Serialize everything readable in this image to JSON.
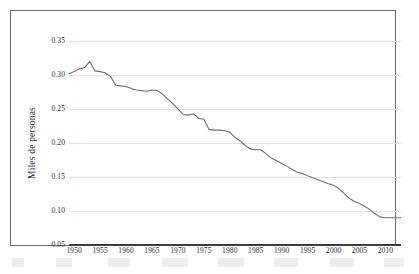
{
  "chart_data": {
    "type": "line",
    "title": "",
    "subtitle": "",
    "xlabel": "",
    "ylabel": "Miles de personas",
    "xlim": [
      1949,
      2013
    ],
    "ylim": [
      0.05,
      0.35
    ],
    "grid": true,
    "legend": false,
    "legend_position": "none",
    "line_color": "#6e6e6e",
    "gridline_color": "#e3e3e3",
    "axis_color": "#3d3d3d",
    "frame_color": "#6b6b6b",
    "ytick_labels": [
      "0.35",
      "0.30",
      "0.25",
      "0.20",
      "0.15",
      "0.10",
      "0.05"
    ],
    "ytick_values": [
      0.35,
      0.3,
      0.25,
      0.2,
      0.15,
      0.1,
      0.05
    ],
    "xtick_labels": [
      "1950",
      "1955",
      "1960",
      "1965",
      "1970",
      "1975",
      "1980",
      "1985",
      "1990",
      "1995",
      "2000",
      "2005",
      "2010"
    ],
    "xtick_values": [
      1950,
      1955,
      1960,
      1965,
      1970,
      1975,
      1980,
      1985,
      1990,
      1995,
      2000,
      2005,
      2010
    ],
    "series": [
      {
        "name": "Miles de personas",
        "x": [
          1949,
          1950,
          1951,
          1952,
          1953,
          1954,
          1955,
          1956,
          1957,
          1958,
          1959,
          1960,
          1961,
          1962,
          1963,
          1964,
          1965,
          1966,
          1967,
          1968,
          1969,
          1970,
          1971,
          1972,
          1973,
          1974,
          1975,
          1976,
          1977,
          1978,
          1979,
          1980,
          1981,
          1982,
          1983,
          1984,
          1985,
          1986,
          1987,
          1988,
          1989,
          1990,
          1991,
          1992,
          1993,
          1994,
          1995,
          1996,
          1997,
          1998,
          1999,
          2000,
          2001,
          2002,
          2003,
          2004,
          2005,
          2006,
          2007,
          2008,
          2009,
          2010,
          2011,
          2012,
          2013
        ],
        "values": [
          0.302,
          0.305,
          0.309,
          0.311,
          0.32,
          0.306,
          0.305,
          0.303,
          0.298,
          0.285,
          0.284,
          0.283,
          0.28,
          0.278,
          0.277,
          0.276,
          0.278,
          0.277,
          0.272,
          0.265,
          0.258,
          0.25,
          0.242,
          0.241,
          0.243,
          0.236,
          0.235,
          0.22,
          0.219,
          0.219,
          0.218,
          0.216,
          0.208,
          0.203,
          0.196,
          0.191,
          0.19,
          0.19,
          0.184,
          0.178,
          0.174,
          0.17,
          0.166,
          0.161,
          0.157,
          0.155,
          0.152,
          0.149,
          0.146,
          0.143,
          0.14,
          0.138,
          0.133,
          0.126,
          0.119,
          0.114,
          0.111,
          0.107,
          0.102,
          0.096,
          0.091,
          0.09,
          0.09,
          0.09,
          0.09
        ]
      }
    ]
  }
}
